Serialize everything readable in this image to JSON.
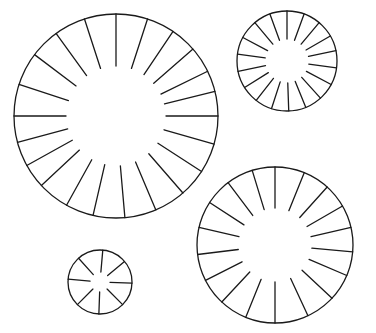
{
  "canvas": {
    "width": 376,
    "height": 333,
    "background": "#ffffff",
    "stroke": "#1a1a1a"
  },
  "wheels": [
    {
      "name": "large-wheel",
      "cx": 116,
      "cy": 116,
      "r": 102,
      "inner_r": 50,
      "spoke_angles_deg": [
        -90,
        -72,
        -56,
        -41,
        -26,
        -14,
        0,
        16,
        33,
        49,
        67,
        85,
        103,
        119,
        137,
        151,
        165,
        180,
        198,
        217,
        234,
        252
      ]
    },
    {
      "name": "small-top-right-wheel",
      "cx": 287,
      "cy": 61,
      "r": 50,
      "inner_r": 22,
      "spoke_angles_deg": [
        -90,
        -70,
        -50,
        -30,
        -12,
        8,
        28,
        48,
        68,
        88,
        108,
        128,
        148,
        168,
        188,
        208,
        230,
        250
      ]
    },
    {
      "name": "bottom-right-wheel",
      "cx": 275,
      "cy": 245,
      "r": 78,
      "inner_r": 37,
      "spoke_angles_deg": [
        -90,
        -68,
        -48,
        -30,
        -13,
        5,
        23,
        43,
        65,
        90,
        112,
        133,
        153,
        173,
        193,
        213,
        233,
        253
      ]
    },
    {
      "name": "tiny-bottom-left-wheel",
      "cx": 100,
      "cy": 282,
      "r": 32,
      "inner_r": 10,
      "spoke_angles_deg": [
        -85,
        -40,
        2,
        45,
        92,
        135,
        185,
        228
      ]
    }
  ]
}
